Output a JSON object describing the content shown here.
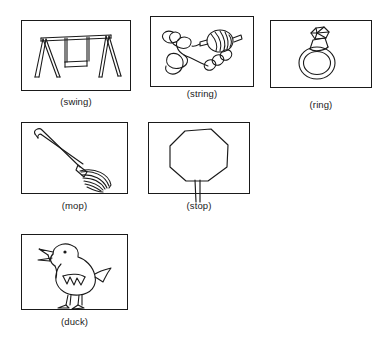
{
  "page": {
    "background_color": "#ffffff",
    "ink_color": "#1a1a1a"
  },
  "panels": [
    {
      "id": "swing",
      "caption": "(swing)",
      "icon": "swing-drawing",
      "description": "A-frame playground swing with hanging seat"
    },
    {
      "id": "string",
      "caption": "(string)",
      "icon": "string-drawing",
      "description": "Spool of thread with curling string and coils"
    },
    {
      "id": "ring",
      "caption": "(ring)",
      "icon": "ring-drawing",
      "description": "Finger ring with faceted gemstone"
    },
    {
      "id": "mop",
      "caption": "(mop)",
      "icon": "mop-drawing",
      "description": "Mop with long diagonal handle and strands"
    },
    {
      "id": "stop",
      "caption": "(stop)",
      "icon": "stop-drawing",
      "description": "Octagonal stop sign on a post"
    },
    {
      "id": "duck",
      "caption": "(duck)",
      "icon": "duck-drawing",
      "description": "Duck facing left with open beak and tail"
    }
  ]
}
